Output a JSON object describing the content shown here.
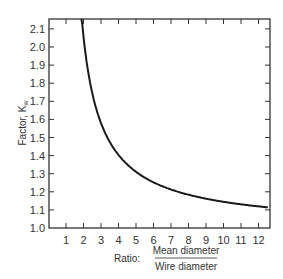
{
  "chart_data": {
    "type": "line",
    "title": "",
    "xlabel": "Ratio: Mean diameter / Wire diameter",
    "xlabel_prefix": "Ratio:",
    "xlabel_numerator": "Mean diameter",
    "xlabel_denominator": "Wire diameter",
    "ylabel": "Factor, Kw",
    "ylabel_text": "Factor, K",
    "ylabel_sub": "w",
    "xlim": [
      0,
      12.5
    ],
    "ylim": [
      1.0,
      2.15
    ],
    "x_ticks": [
      "1",
      "2",
      "3",
      "4",
      "5",
      "6",
      "7",
      "8",
      "9",
      "10",
      "11",
      "12"
    ],
    "y_ticks": [
      "1.0",
      "1.1",
      "1.2",
      "1.3",
      "1.4",
      "1.5",
      "1.6",
      "1.7",
      "1.8",
      "1.9",
      "2.0",
      "2.1"
    ],
    "grid": false,
    "series": [
      {
        "name": "Kw",
        "x": [
          1.9,
          2,
          2.5,
          3,
          3.5,
          4,
          4.5,
          5,
          6,
          7,
          8,
          9,
          10,
          11,
          12,
          12.5
        ],
        "values": [
          2.15,
          2.06,
          1.75,
          1.58,
          1.48,
          1.4,
          1.35,
          1.31,
          1.25,
          1.21,
          1.18,
          1.16,
          1.15,
          1.13,
          1.12,
          1.11
        ]
      }
    ]
  }
}
